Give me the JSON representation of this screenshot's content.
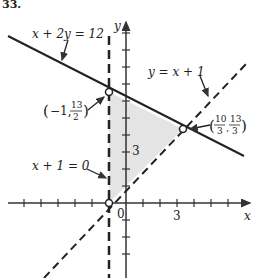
{
  "problem_number": "33.",
  "axes": {
    "x_label": "x",
    "y_label": "y",
    "origin_label": "0",
    "x_tick_label": "3",
    "y_tick_label": "3"
  },
  "lines": [
    {
      "id": "line1",
      "equation": "x + 2y = 12",
      "style": "solid"
    },
    {
      "id": "line2",
      "equation": "y = x + 1",
      "style": "dashed"
    },
    {
      "id": "line3",
      "equation": "x + 1 = 0",
      "style": "dashed"
    }
  ],
  "points": [
    {
      "id": "p1",
      "label_x": "−1,",
      "label_num": "13",
      "label_den": "2",
      "open": true
    },
    {
      "id": "p2",
      "label_num1": "10",
      "label_den1": "3",
      "label_num2": "13",
      "label_den2": "3",
      "open": true
    },
    {
      "id": "p3",
      "open": true
    }
  ],
  "region": {
    "fill": "#e6e6e6",
    "description": "shaded feasible region"
  }
}
